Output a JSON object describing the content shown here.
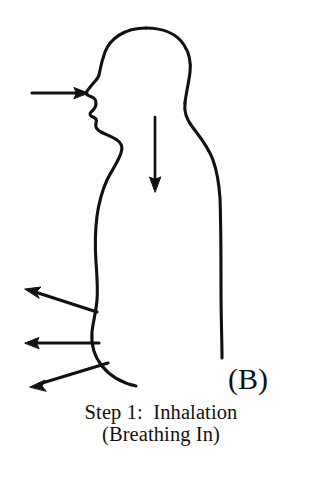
{
  "figure": {
    "panel_label": "(B)",
    "caption_line_1": "Step 1:  Inhalation",
    "caption_line_2": "(Breathing In)",
    "ink_color": "#111111",
    "background_color": "#ffffff",
    "annotations": {
      "mouth_arrow_label": "air-in-at-mouth-arrow",
      "trachea_arrow_label": "air-down-trachea-arrow",
      "abdomen_arrow_1_label": "abdomen-expansion-arrow-upper",
      "abdomen_arrow_2_label": "abdomen-expansion-arrow-middle",
      "abdomen_arrow_3_label": "abdomen-expansion-arrow-lower"
    }
  }
}
